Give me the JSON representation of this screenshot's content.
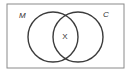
{
  "diagram": {
    "type": "venn",
    "universe": {
      "x": 7,
      "y": 4,
      "width": 117,
      "height": 64,
      "stroke": "#8a8a8a"
    },
    "sets": [
      {
        "label": "M",
        "cx": 53,
        "cy": 37,
        "r": 25,
        "label_x": 19,
        "label_y": 18
      },
      {
        "label": "C",
        "cx": 78,
        "cy": 37,
        "r": 25,
        "label_x": 103,
        "label_y": 17
      }
    ],
    "intersection_label": {
      "text": "X",
      "x": 65,
      "y": 39
    },
    "circle_stroke": "#3c3c3c"
  }
}
